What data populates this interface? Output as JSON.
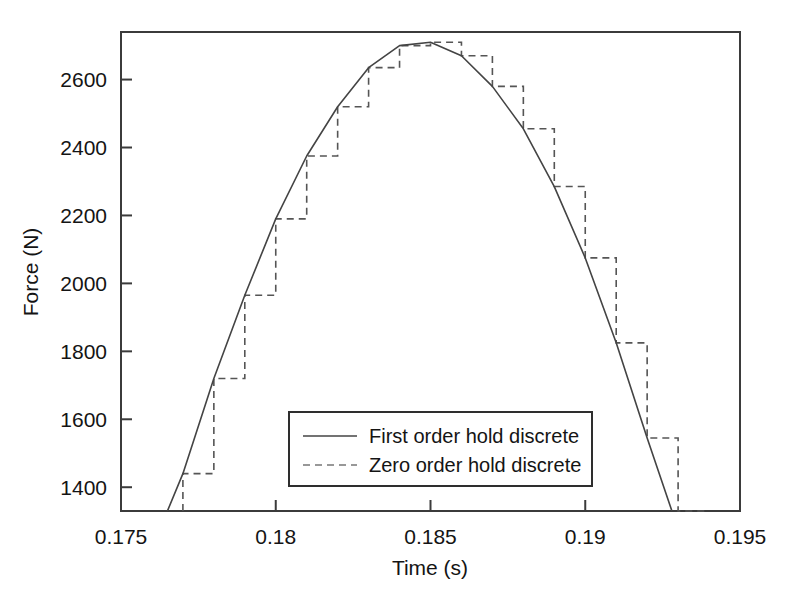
{
  "chart_data": {
    "type": "line",
    "title": "",
    "xlabel": "Time (s)",
    "ylabel": "Force (N)",
    "xlim": [
      0.175,
      0.195
    ],
    "ylim": [
      1330,
      2740
    ],
    "xticks": [
      0.175,
      0.18,
      0.185,
      0.19,
      0.195
    ],
    "xticklabels": [
      "0.175",
      "0.18",
      "0.185",
      "0.19",
      "0.195"
    ],
    "yticks": [
      1400,
      1600,
      1800,
      2000,
      2200,
      2400,
      2600
    ],
    "yticklabels": [
      "1400",
      "1600",
      "1800",
      "2000",
      "2200",
      "2400",
      "2600"
    ],
    "grid": false,
    "legend_position": "lower center",
    "sample_period": 0.001,
    "series": [
      {
        "name": "First order hold discrete",
        "style": "solid",
        "color": "#444444",
        "x": [
          0.1765,
          0.177,
          0.178,
          0.179,
          0.18,
          0.181,
          0.182,
          0.183,
          0.184,
          0.185,
          0.186,
          0.187,
          0.188,
          0.189,
          0.19,
          0.191,
          0.192,
          0.1928
        ],
        "values": [
          1330,
          1440,
          1720,
          1965,
          2190,
          2375,
          2520,
          2635,
          2700,
          2710,
          2670,
          2580,
          2455,
          2285,
          2075,
          1825,
          1545,
          1330
        ]
      },
      {
        "name": "Zero order hold discrete",
        "style": "dashed",
        "color": "#555555",
        "x": [
          0.177,
          0.178,
          0.179,
          0.18,
          0.181,
          0.182,
          0.183,
          0.184,
          0.185,
          0.186,
          0.187,
          0.188,
          0.189,
          0.19,
          0.191,
          0.192,
          0.193
        ],
        "values": [
          1440,
          1720,
          1965,
          2190,
          2375,
          2520,
          2635,
          2700,
          2710,
          2670,
          2580,
          2455,
          2285,
          2075,
          1825,
          1545,
          1330
        ]
      }
    ]
  },
  "legend": {
    "entries": [
      {
        "label": "First order hold discrete",
        "style": "solid"
      },
      {
        "label": "Zero order hold discrete",
        "style": "dashed"
      }
    ]
  }
}
